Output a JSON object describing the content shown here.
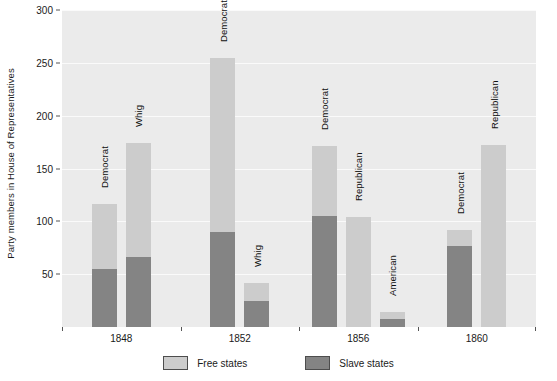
{
  "chart_data": {
    "type": "bar",
    "subtype": "stacked-grouped",
    "title": "",
    "xlabel": "",
    "ylabel": "Party members in House of Representatives",
    "ylim": [
      0,
      300
    ],
    "yticks": [
      50,
      100,
      150,
      200,
      250,
      300
    ],
    "categories": [
      "1848",
      "1852",
      "1856",
      "1860"
    ],
    "grid": true,
    "legend": {
      "position": "bottom",
      "entries": [
        {
          "label": "Free states",
          "color": "#cccccc"
        },
        {
          "label": "Slave states",
          "color": "#848484"
        }
      ]
    },
    "series": [
      {
        "name": "Free states",
        "color": "#cccccc"
      },
      {
        "name": "Slave states",
        "color": "#848484"
      }
    ],
    "bars": [
      {
        "group": "1848",
        "label": "Democrat",
        "slave_states": 55,
        "free_states": 61,
        "total": 116
      },
      {
        "group": "1848",
        "label": "Whig",
        "slave_states": 66,
        "free_states": 108,
        "total": 174
      },
      {
        "group": "1852",
        "label": "Democrat",
        "slave_states": 90,
        "free_states": 165,
        "total": 255
      },
      {
        "group": "1852",
        "label": "Whig",
        "slave_states": 25,
        "free_states": 17,
        "total": 42
      },
      {
        "group": "1856",
        "label": "Democrat",
        "slave_states": 105,
        "free_states": 66,
        "total": 171
      },
      {
        "group": "1856",
        "label": "Republican",
        "slave_states": 0,
        "free_states": 104,
        "total": 104
      },
      {
        "group": "1856",
        "label": "American",
        "slave_states": 8,
        "free_states": 6,
        "total": 14
      },
      {
        "group": "1860",
        "label": "Democrat",
        "slave_states": 77,
        "free_states": 15,
        "total": 92
      },
      {
        "group": "1860",
        "label": "Republican",
        "slave_states": 0,
        "free_states": 172,
        "total": 172
      }
    ]
  },
  "axis": {
    "y_title": "Party members in House of Representatives",
    "y_tick_labels": [
      "300",
      "250",
      "200",
      "150",
      "100",
      "50"
    ],
    "x_tick_labels": [
      "1848",
      "1852",
      "1856",
      "1860"
    ]
  },
  "legend": {
    "free_label": "Free states",
    "slave_label": "Slave states"
  },
  "colors": {
    "free_states": "#cccccc",
    "slave_states": "#848484",
    "plot_background": "#ebebeb",
    "gridline": "#fafafa",
    "text": "#1a1a1a"
  }
}
